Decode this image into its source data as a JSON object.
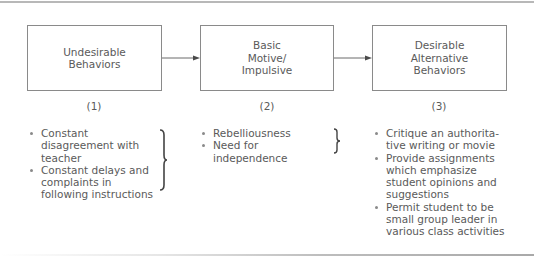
{
  "diagram": {
    "boxes": [
      {
        "id": 1,
        "label": "Undesirable\nBehaviors",
        "number": "(1)"
      },
      {
        "id": 2,
        "label": "Basic\nMotive/\nImpulsive",
        "number": "(2)"
      },
      {
        "id": 3,
        "label": "Desirable\nAlternative\nBehaviors",
        "number": "(3)"
      }
    ],
    "lists": [
      {
        "items": [
          "Constant disagreement with teacher",
          "Constant delays and complaints in following instructions"
        ]
      },
      {
        "items": [
          "Rebelliousness",
          "Need for independence"
        ]
      },
      {
        "items": [
          "Critique an authorita-tive writing or movie",
          "Provide assignments which emphasize student opinions and suggestions",
          "Permit student to be small group leader in various class activities"
        ]
      }
    ],
    "colors": {
      "border": "#8a8a8a",
      "text": "#5a5a5a",
      "rule": "#b8b8b8"
    }
  }
}
